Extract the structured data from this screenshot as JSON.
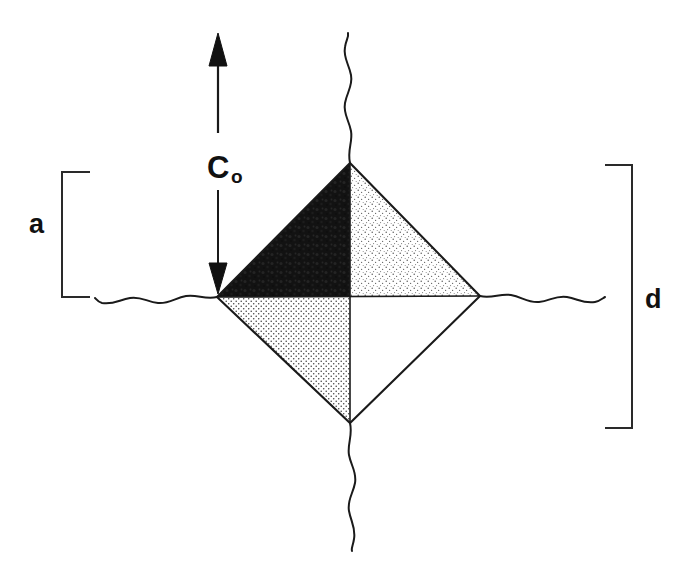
{
  "figure": {
    "background_color": "#ffffff",
    "stroke_color": "#1a1a1a",
    "width": 690,
    "height": 579
  },
  "labels": {
    "load_symbol_base": "C",
    "load_symbol_sub": "o",
    "load_symbol_full": "Co",
    "left_bracket_label": "a",
    "right_bracket_label": "d"
  },
  "annotations": {
    "arrow_up_name": "up-arrow",
    "arrow_down_name": "down-arrow",
    "left_bracket_name": "dimension-bracket-a",
    "right_bracket_name": "dimension-bracket-d"
  },
  "geometry": {
    "diamond_vertices": {
      "top": [
        350,
        163
      ],
      "right": [
        480,
        296
      ],
      "bottom": [
        350,
        423
      ],
      "left": [
        217,
        297
      ]
    },
    "center": [
      350,
      296
    ],
    "arrow_x": 218,
    "arrow_up_tip_y": 33,
    "arrow_shaft_top_y": 132,
    "arrow_down_tip_y": 294,
    "left_bracket": {
      "x": 62,
      "top": 172,
      "bottom": 297,
      "serif_to": 90
    },
    "right_bracket": {
      "x": 632,
      "top": 165,
      "bottom": 428,
      "serif_to": 605
    },
    "wavy_top": {
      "x": 350,
      "from_y": 33,
      "to_y": 163
    },
    "wavy_bottom": {
      "x": 350,
      "from_y": 423,
      "to_y": 550
    },
    "wavy_left": {
      "y": 297,
      "from_x": 95,
      "to_x": 217
    },
    "wavy_right": {
      "y": 296,
      "from_x": 480,
      "to_x": 605
    }
  },
  "quadrants": [
    {
      "name": "top-left",
      "fill": "solid-black",
      "color": "#141414"
    },
    {
      "name": "top-right",
      "fill": "light-stipple",
      "color": "#5a5a5a"
    },
    {
      "name": "bottom-left",
      "fill": "medium-stipple",
      "color": "#4a4a4a"
    },
    {
      "name": "bottom-right",
      "fill": "none",
      "color": "#ffffff"
    }
  ]
}
